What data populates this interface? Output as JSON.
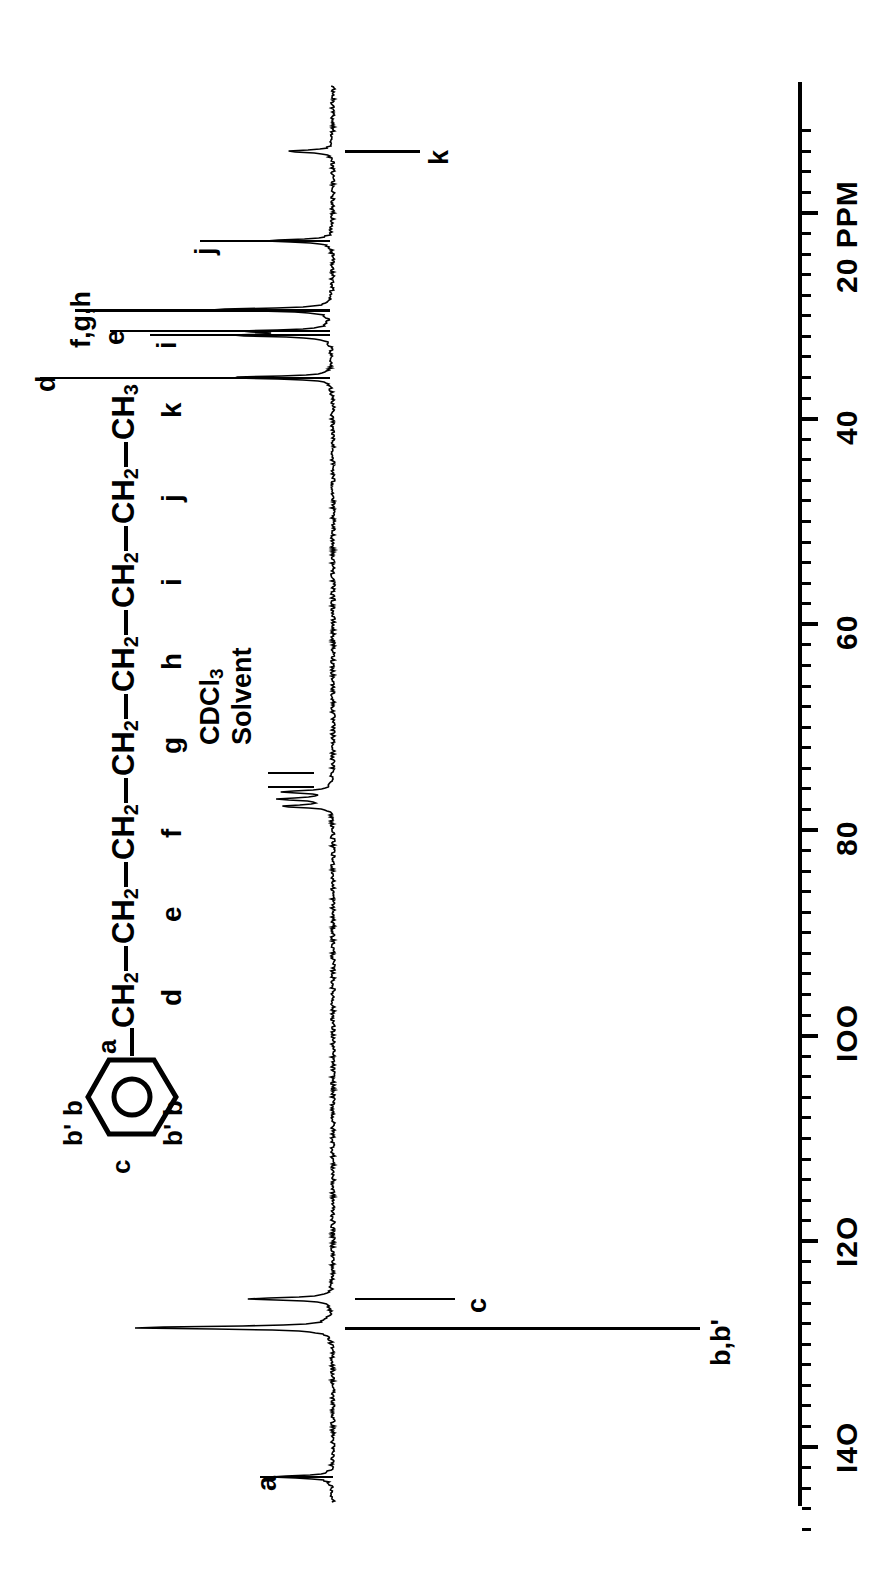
{
  "spectrum": {
    "type": "nmr-13c-spectrum",
    "nucleus": "13C",
    "axis_unit": "PPM",
    "axis_unit_label": "20 PPM",
    "solvent_note_line1": "CDCl",
    "solvent_note_sub": "3",
    "solvent_note_line2": "Solvent",
    "orientation": "rotated-90-ccw"
  },
  "axis": {
    "unit": "PPM",
    "major_ticks": [
      {
        "value": 20,
        "label": "20 PPM"
      },
      {
        "value": 40,
        "label": "40"
      },
      {
        "value": 60,
        "label": "60"
      },
      {
        "value": 80,
        "label": "80"
      },
      {
        "value": 100,
        "label": "IOO"
      },
      {
        "value": 120,
        "label": "I2O"
      },
      {
        "value": 140,
        "label": "I4O"
      }
    ],
    "minor_tick_interval": 2,
    "range_ppm": [
      12,
      148
    ],
    "direction": "increasing-downward"
  },
  "peak_labels": [
    {
      "id": "k",
      "label": "k",
      "ppm": 14.0
    },
    {
      "id": "j",
      "label": "j",
      "ppm": 22.7
    },
    {
      "id": "fgh",
      "label": "f,g,h",
      "ppm": 29.4
    },
    {
      "id": "e",
      "label": "e",
      "ppm": 31.5
    },
    {
      "id": "i",
      "label": "i",
      "ppm": 31.9
    },
    {
      "id": "d",
      "label": "d",
      "ppm": 36.0
    },
    {
      "id": "c",
      "label": "c",
      "ppm": 125.6
    },
    {
      "id": "bbp",
      "label": "b,b'",
      "ppm": 128.4
    },
    {
      "id": "a",
      "label": "a",
      "ppm": 142.9
    }
  ],
  "structure": {
    "name": "alkylbenzene-chain",
    "chain_text": "CH2—CH2—CH2—CH2—CH2—CH2—CH2—CH3",
    "chain_units": [
      {
        "formula": "CH",
        "sub": "2",
        "letter": "d"
      },
      {
        "formula": "CH",
        "sub": "2",
        "letter": "e"
      },
      {
        "formula": "CH",
        "sub": "2",
        "letter": "f"
      },
      {
        "formula": "CH",
        "sub": "2",
        "letter": "g"
      },
      {
        "formula": "CH",
        "sub": "2",
        "letter": "h"
      },
      {
        "formula": "CH",
        "sub": "2",
        "letter": "i"
      },
      {
        "formula": "CH",
        "sub": "2",
        "letter": "j"
      },
      {
        "formula": "CH",
        "sub": "3",
        "letter": "k"
      }
    ],
    "ring_labels": {
      "ipso": "a",
      "ortho_left": "b",
      "ortho_right": "b",
      "meta_left": "b'",
      "meta_right": "b'",
      "para": "c"
    }
  },
  "chart_data": {
    "type": "line",
    "title": "",
    "xlabel": "PPM",
    "ylabel": "",
    "xlim": [
      148,
      12
    ],
    "grid": false,
    "legend": "none",
    "peaks": [
      {
        "label": "a",
        "ppm": 142.9,
        "rel_height": 0.3
      },
      {
        "label": "b,b'",
        "ppm": 128.4,
        "rel_height": 1.0
      },
      {
        "label": "c",
        "ppm": 125.6,
        "rel_height": 0.42
      },
      {
        "label": "CDCl3",
        "ppm": 77.7,
        "rel_height": 0.24
      },
      {
        "label": "CDCl3",
        "ppm": 77.0,
        "rel_height": 0.26
      },
      {
        "label": "CDCl3",
        "ppm": 76.3,
        "rel_height": 0.24
      },
      {
        "label": "d",
        "ppm": 36.0,
        "rel_height": 0.52
      },
      {
        "label": "i",
        "ppm": 31.9,
        "rel_height": 0.46
      },
      {
        "label": "e",
        "ppm": 31.5,
        "rel_height": 0.4
      },
      {
        "label": "f,g,h",
        "ppm": 29.4,
        "rel_height": 0.62
      },
      {
        "label": "j",
        "ppm": 22.7,
        "rel_height": 0.34
      },
      {
        "label": "k",
        "ppm": 14.0,
        "rel_height": 0.22
      }
    ]
  }
}
